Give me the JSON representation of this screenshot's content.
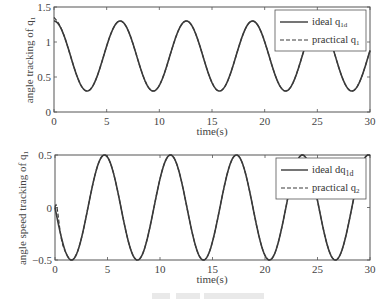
{
  "chart_data": [
    {
      "type": "line",
      "title": "",
      "xlabel": "time(s)",
      "ylabel": "angle tracking of q1",
      "xlim": [
        0,
        30
      ],
      "ylim": [
        0,
        1.5
      ],
      "xticks": [
        0,
        5,
        10,
        15,
        20,
        25,
        30
      ],
      "yticks": [
        0,
        0.5,
        1,
        1.5
      ],
      "ytick_labels": [
        "0",
        "0.5",
        "1",
        "1.5"
      ],
      "grid": false,
      "legend_position": "upper right",
      "series": [
        {
          "name": "ideal q1d",
          "style": "solid",
          "formula": "0.8 + 0.5*cos(t)",
          "min": 0.3,
          "max": 1.3
        },
        {
          "name": "practical q1",
          "style": "dashed",
          "formula": "tracks ideal after initial transient (starts ~1.35)",
          "initial": 1.35
        }
      ]
    },
    {
      "type": "line",
      "title": "",
      "xlabel": "time(s)",
      "ylabel": "angle speed tracking of q1",
      "xlim": [
        0,
        30
      ],
      "ylim": [
        -0.5,
        0.5
      ],
      "xticks": [
        0,
        5,
        10,
        15,
        20,
        25,
        30
      ],
      "yticks": [
        -0.5,
        0,
        0.5
      ],
      "ytick_labels": [
        "-0.5",
        "0",
        "0.5"
      ],
      "grid": false,
      "legend_position": "upper right",
      "series": [
        {
          "name": "ideal dq1d",
          "style": "solid",
          "formula": "-0.5*sin(t)",
          "min": -0.5,
          "max": 0.5
        },
        {
          "name": "practical q2",
          "style": "dashed",
          "formula": "starts at 0, transient around -0.3 near t=0.5, then tracks ideal",
          "initial": 0.0
        }
      ]
    }
  ],
  "plots": {
    "top": {
      "ylabel_main": "angle tracking of q",
      "ylabel_sub": "1",
      "xlabel": "time(s)",
      "yticks": [
        "0",
        "0.5",
        "1",
        "1.5"
      ],
      "xticks": [
        "0",
        "5",
        "10",
        "15",
        "20",
        "25",
        "30"
      ],
      "legend": [
        {
          "main": "ideal q",
          "sub": "1d"
        },
        {
          "main": "practical q",
          "sub": "1"
        }
      ]
    },
    "bottom": {
      "ylabel_main": "angle speed tracking of q",
      "ylabel_sub": "1",
      "xlabel": "time(s)",
      "yticks": [
        "−0.5",
        "0",
        "0.5"
      ],
      "xticks": [
        "0",
        "5",
        "10",
        "15",
        "20",
        "25",
        "30"
      ],
      "legend": [
        {
          "main": "ideal dq",
          "sub": "1d"
        },
        {
          "main": "practical q",
          "sub": "2"
        }
      ]
    }
  },
  "colors": {
    "line": "#3a3a3a",
    "axis": "#555555",
    "text": "#444444",
    "caption": "#d8d8d8"
  }
}
